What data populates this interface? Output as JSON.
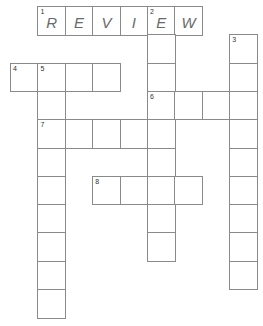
{
  "puzzle": {
    "type": "crossword",
    "origin_x": 10,
    "origin_y": 6,
    "cell_w": 27.4,
    "cell_h": 28.3,
    "border_color": "#8a8a8a",
    "letter_color": "#6a6a6a",
    "clues": [
      {
        "number": "1",
        "direction": "across",
        "row": 0,
        "col": 1,
        "length": 6,
        "answer": "REVIEW"
      },
      {
        "number": "2",
        "direction": "down",
        "row": 0,
        "col": 5,
        "length": 9,
        "answer": "E"
      },
      {
        "number": "3",
        "direction": "down",
        "row": 1,
        "col": 8,
        "length": 9,
        "answer": ""
      },
      {
        "number": "4",
        "direction": "across",
        "row": 2,
        "col": 0,
        "length": 4,
        "answer": ""
      },
      {
        "number": "5",
        "direction": "down",
        "row": 2,
        "col": 1,
        "length": 9,
        "answer": ""
      },
      {
        "number": "6",
        "direction": "across",
        "row": 3,
        "col": 5,
        "length": 4,
        "answer": ""
      },
      {
        "number": "7",
        "direction": "across",
        "row": 4,
        "col": 1,
        "length": 5,
        "answer": ""
      },
      {
        "number": "8",
        "direction": "across",
        "row": 6,
        "col": 3,
        "length": 4,
        "answer": ""
      }
    ],
    "filled_letters": [
      "R",
      "E",
      "V",
      "I",
      "E",
      "W"
    ]
  }
}
